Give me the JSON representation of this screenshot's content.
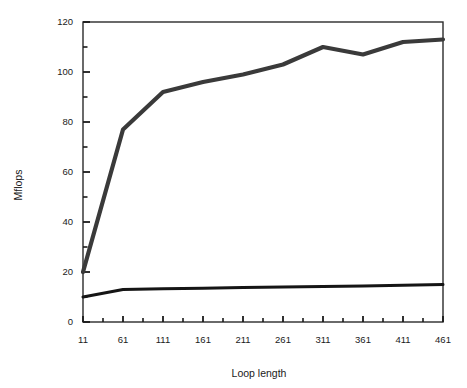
{
  "chart_data": {
    "type": "line",
    "title": "",
    "xlabel": "Loop length",
    "ylabel": "Mflops",
    "x": [
      11,
      61,
      111,
      161,
      211,
      261,
      311,
      361,
      411,
      461
    ],
    "xtick_labels": [
      "11",
      "61",
      "111",
      "161",
      "211",
      "261",
      "311",
      "361",
      "411",
      "461"
    ],
    "ytick_labels": [
      "0",
      "20",
      "40",
      "60",
      "80",
      "100",
      "120"
    ],
    "ytick_values": [
      0,
      20,
      40,
      60,
      80,
      100,
      120
    ],
    "yminor_values": [
      10,
      30,
      50,
      70,
      90,
      110
    ],
    "xlim": [
      11,
      461
    ],
    "ylim": [
      0,
      120
    ],
    "grid": false,
    "legend": "none",
    "series": [
      {
        "name": "upper",
        "values": [
          20,
          77,
          92,
          96,
          99,
          103,
          110,
          107,
          112,
          113
        ],
        "color": "#3a3a3a",
        "width": 4.2
      },
      {
        "name": "lower",
        "values": [
          10,
          13,
          13.3,
          13.5,
          13.8,
          14,
          14.2,
          14.4,
          14.7,
          15
        ],
        "color": "#151515",
        "width": 3.0
      }
    ]
  },
  "axes": {
    "frame_color": "#2b2b2b",
    "tick_color": "#1a1a1a"
  }
}
